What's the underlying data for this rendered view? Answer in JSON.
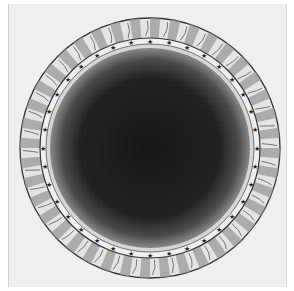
{
  "image": {
    "subject": "Engraved celestial diagram: dark speckled central disc surrounded by a ring of stars and an outer ring of flame-like rays",
    "colors": {
      "paper": "#efefee",
      "ink": "#1a1a1a",
      "ray_shade": "#9a9a9a",
      "ring_light": "#e6e6e6"
    },
    "elements": {
      "center_disc": "dark stippled sphere",
      "star_band": "band of small stars",
      "outer_ring": "radiating rays with flame shapes"
    }
  }
}
